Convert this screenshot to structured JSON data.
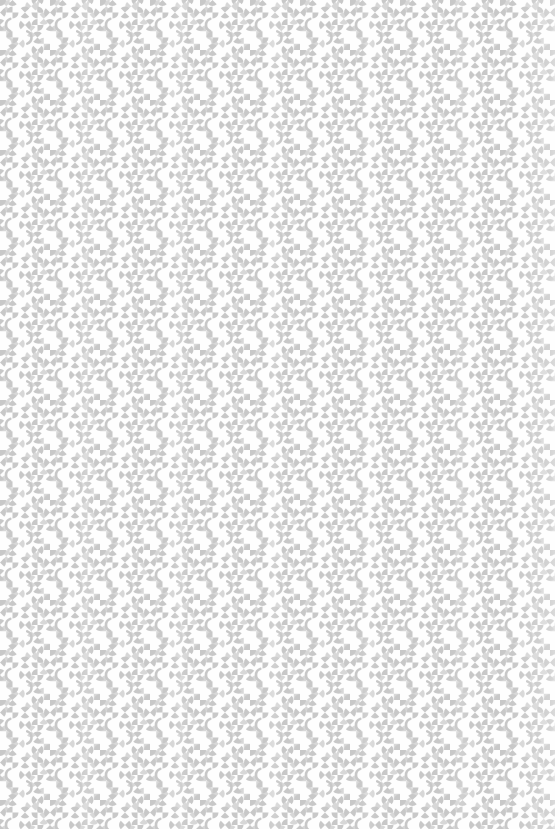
{
  "canvas": {
    "width": 555,
    "height": 829,
    "background": "#ffffff"
  },
  "pattern": {
    "tile_size": 50,
    "glyph_radius": 6,
    "arc_radius": 6.5,
    "arc_stroke_width": 2.6,
    "colors": {
      "background": "#ffffff",
      "main": "#c8c8c8",
      "light": "#d8d8d8"
    },
    "cells": [
      {
        "x": 6.25,
        "y": 6.25,
        "type": "pie2",
        "a0": 45,
        "tone": "light"
      },
      {
        "x": 31.25,
        "y": 6.25,
        "type": "pie2",
        "a0": -45,
        "tone": "light"
      },
      {
        "x": 43.75,
        "y": 6.25,
        "type": "arc",
        "t0": 110,
        "t1": 250,
        "tone": "light"
      },
      {
        "x": 43.75,
        "y": 18.75,
        "type": "pie2",
        "a0": 45,
        "tone": "light"
      },
      {
        "x": 6.25,
        "y": 31.25,
        "type": "pie2",
        "a0": 0,
        "tone": "light"
      },
      {
        "x": 31.25,
        "y": 31.25,
        "type": "pie2",
        "a0": 45,
        "tone": "light"
      },
      {
        "x": 18.75,
        "y": 43.75,
        "type": "pie2",
        "a0": -45,
        "tone": "light"
      },
      {
        "x": 43.75,
        "y": 43.75,
        "type": "pie2",
        "a0": 0,
        "tone": "light"
      },
      {
        "x": 6.25,
        "y": 43.75,
        "type": "arc",
        "t0": -70,
        "t1": 70,
        "tone": "light"
      },
      {
        "x": 0,
        "y": 0,
        "type": "pie2",
        "a0": 0,
        "tone": "main"
      },
      {
        "x": 12.5,
        "y": 0,
        "type": "pie2",
        "a0": 45,
        "tone": "main"
      },
      {
        "x": 37.5,
        "y": 0,
        "type": "pie2",
        "a0": -45,
        "tone": "main"
      },
      {
        "x": 0,
        "y": 12.5,
        "type": "pie2",
        "a0": -45,
        "tone": "main"
      },
      {
        "x": 12.5,
        "y": 12.5,
        "type": "pie2",
        "a0": 0,
        "tone": "main"
      },
      {
        "x": 25,
        "y": 12.5,
        "type": "pie2",
        "a0": 45,
        "tone": "main"
      },
      {
        "x": 37.5,
        "y": 12.5,
        "type": "pie2",
        "a0": 90,
        "tone": "main"
      },
      {
        "x": 0,
        "y": 25,
        "type": "pie2",
        "a0": 45,
        "tone": "main"
      },
      {
        "x": 12.5,
        "y": 25,
        "type": "arc",
        "t0": 110,
        "t1": 250,
        "tone": "main"
      },
      {
        "x": 25,
        "y": 25,
        "type": "pie2",
        "a0": -45,
        "tone": "main"
      },
      {
        "x": 37.5,
        "y": 25,
        "type": "pie2",
        "a0": 0,
        "tone": "main"
      },
      {
        "x": 12.5,
        "y": 37.5,
        "type": "pie2",
        "a0": 0,
        "tone": "main"
      },
      {
        "x": 25,
        "y": 37.5,
        "type": "arc",
        "t0": -70,
        "t1": 70,
        "tone": "main"
      },
      {
        "x": 37.5,
        "y": 37.5,
        "type": "pie2",
        "a0": 45,
        "tone": "main"
      }
    ]
  }
}
